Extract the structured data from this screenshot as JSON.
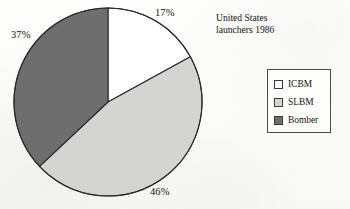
{
  "chart_data": {
    "type": "pie",
    "title": "United States\nlaunchers 1986",
    "title_lines": [
      "United States",
      "launchers 1986"
    ],
    "categories": [
      "ICBM",
      "SLBM",
      "Bomber"
    ],
    "values": [
      17,
      46,
      37
    ],
    "value_labels": [
      "17%",
      "46%",
      "37%"
    ],
    "units": "percent",
    "start_angle_deg": 0,
    "direction": "clockwise",
    "colors": [
      "#ffffff",
      "#d4d4d2",
      "#6e6e6e"
    ],
    "outline_color": "#2b2b2b",
    "legend_position": "right",
    "grid": false,
    "xlabel": "",
    "ylabel": "",
    "slices": [
      {
        "name": "ICBM",
        "value": 17,
        "label": "17%",
        "color": "#ffffff",
        "label_x": 155,
        "label_y": 7
      },
      {
        "name": "SLBM",
        "value": 46,
        "label": "46%",
        "color": "#d4d4d2",
        "label_x": 150,
        "label_y": 186
      },
      {
        "name": "Bomber",
        "value": 37,
        "label": "37%",
        "color": "#6e6e6e",
        "label_x": 11,
        "label_y": 29
      }
    ],
    "geometry": {
      "center_x": 108,
      "center_y": 102,
      "radius": 94
    }
  },
  "legend": {
    "rows": [
      {
        "label": "ICBM",
        "color": "#ffffff"
      },
      {
        "label": "SLBM",
        "color": "#d4d4d2"
      },
      {
        "label": "Bomber",
        "color": "#6e6e6e"
      }
    ]
  }
}
